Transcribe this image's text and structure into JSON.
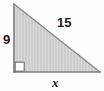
{
  "figure": {
    "kind": "right-triangle-diagram",
    "background_color": "#fefefe",
    "outline_color": "#7d7d7d",
    "fill_color": "#cccccc",
    "fill_stripe_color": "#d8d8d8",
    "label_color": "#1b1b1b",
    "right_angle_marker": {
      "present": true,
      "position": "bottom-left",
      "fill_color": "#ffffff",
      "stroke_color": "#6e6e6e"
    },
    "vertices": {
      "apex": {
        "x": 14,
        "y": 4
      },
      "right_angle": {
        "x": 14,
        "y": 72
      },
      "right_end": {
        "x": 100,
        "y": 72
      }
    },
    "labels": {
      "vertical_leg": "9",
      "hypotenuse": "15",
      "horizontal_leg": "x"
    }
  }
}
